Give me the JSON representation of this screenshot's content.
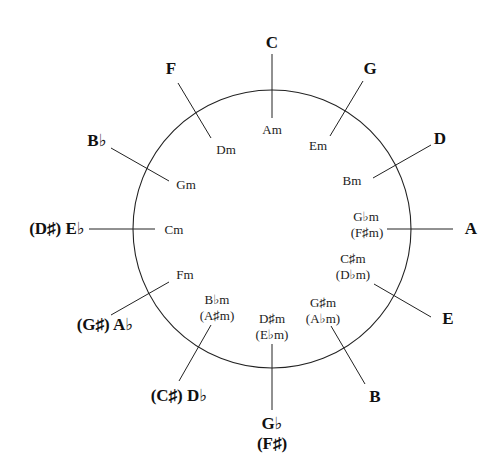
{
  "circle": {
    "cx": 272,
    "cy": 229,
    "r": 139
  },
  "keys": [
    {
      "major": "C",
      "major_alt": "",
      "minor": "Am",
      "minor_alt": ""
    },
    {
      "major": "G",
      "major_alt": "",
      "minor": "Em",
      "minor_alt": ""
    },
    {
      "major": "D",
      "major_alt": "",
      "minor": "Bm",
      "minor_alt": ""
    },
    {
      "major": "A",
      "major_alt": "",
      "minor": "G♭m",
      "minor_alt": "(F♯m)"
    },
    {
      "major": "E",
      "major_alt": "",
      "minor": "C♯m",
      "minor_alt": "(D♭m)"
    },
    {
      "major": "B",
      "major_alt": "",
      "minor": "G♯m",
      "minor_alt": "(A♭m)"
    },
    {
      "major": "G♭",
      "major_alt": "(F♯)",
      "minor": "D♯m",
      "minor_alt": "(E♭m)"
    },
    {
      "major": "(C♯) D♭",
      "major_alt": "",
      "minor": "B♭m",
      "minor_alt": "(A♯m)"
    },
    {
      "major": "(G♯) A♭",
      "major_alt": "",
      "minor": "Fm",
      "minor_alt": ""
    },
    {
      "major": "(D♯) E♭",
      "major_alt": "",
      "minor": "Cm",
      "minor_alt": ""
    },
    {
      "major": "B♭",
      "major_alt": "",
      "minor": "Gm",
      "minor_alt": ""
    },
    {
      "major": "F",
      "major_alt": "",
      "minor": "Dm",
      "minor_alt": ""
    }
  ]
}
